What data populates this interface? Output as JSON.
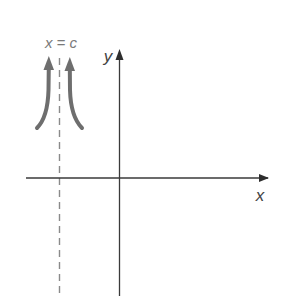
{
  "diagram": {
    "type": "vertical-asymptote-graph",
    "asymptote_label": "x = c",
    "x_axis_label": "x",
    "y_axis_label": "y",
    "colors": {
      "axis": "#3a3a3a",
      "asymptote": "#8a8a8a",
      "arrows": "#6e6e6e",
      "asymptote_label": "#7a7a7a",
      "axis_label": "#444444"
    },
    "elements": [
      {
        "name": "x-axis",
        "description": "horizontal axis with arrow pointing right"
      },
      {
        "name": "y-axis",
        "description": "vertical axis with arrow pointing up"
      },
      {
        "name": "vertical-asymptote",
        "description": "dashed vertical line left of y-axis"
      },
      {
        "name": "left-branch-arrow",
        "description": "curved arrow rising toward asymptote from left"
      },
      {
        "name": "right-branch-arrow",
        "description": "curved arrow rising toward asymptote from right"
      }
    ]
  }
}
